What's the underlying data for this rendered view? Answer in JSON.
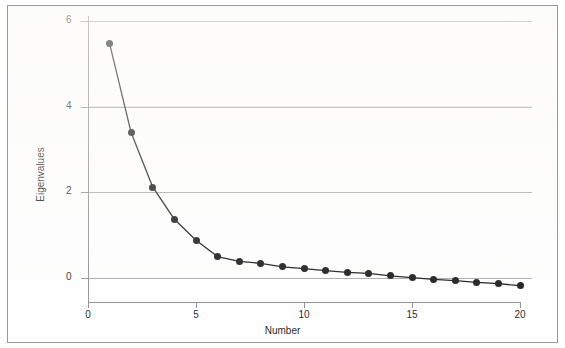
{
  "chart_data": {
    "type": "line",
    "title": "",
    "subtitle": "",
    "xlabel": "Number",
    "ylabel": "Eigenvalues",
    "xlim": [
      0,
      20.8
    ],
    "ylim": [
      -0.35,
      6.3
    ],
    "xticks": [
      0,
      5,
      10,
      15,
      20
    ],
    "xtick_labels": [
      "0",
      "5",
      "10",
      "15",
      "20"
    ],
    "yticks": [
      0,
      2,
      4,
      6
    ],
    "ytick_labels": [
      "0",
      "2",
      "4",
      "6"
    ],
    "grid": "horizontal",
    "legend": "none",
    "marker": "filled-circle",
    "line_color": "#141414",
    "marker_color": "#141414",
    "grid_color": "#a8a8a8",
    "background_color": "#ffffff",
    "frame_color": "#9a9a9a",
    "x": [
      1,
      2,
      3,
      4,
      5,
      6,
      7,
      8,
      9,
      10,
      11,
      12,
      13,
      14,
      15,
      16,
      17,
      18,
      19,
      20
    ],
    "values": [
      5.47,
      3.39,
      2.12,
      1.37,
      0.88,
      0.5,
      0.39,
      0.34,
      0.26,
      0.22,
      0.17,
      0.13,
      0.11,
      0.05,
      0.01,
      -0.03,
      -0.06,
      -0.1,
      -0.13,
      -0.18
    ],
    "series": [
      {
        "name": "Eigenvalues",
        "values": [
          5.47,
          3.39,
          2.12,
          1.37,
          0.88,
          0.5,
          0.39,
          0.34,
          0.26,
          0.22,
          0.17,
          0.13,
          0.11,
          0.05,
          0.01,
          -0.03,
          -0.06,
          -0.1,
          -0.13,
          -0.18
        ]
      }
    ]
  },
  "figure": {
    "xlabel": "Number",
    "ylabel": "Eigenvalues"
  }
}
